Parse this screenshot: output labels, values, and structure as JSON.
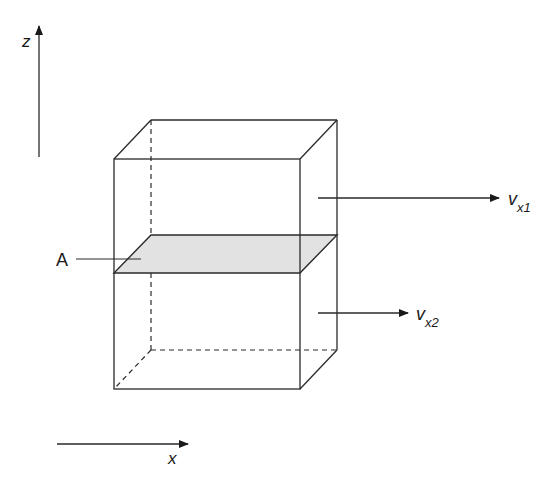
{
  "diagram": {
    "type": "3d-box-shear-flow",
    "axes": {
      "z": {
        "label": "z",
        "direction": "up"
      },
      "x": {
        "label": "x",
        "direction": "right"
      }
    },
    "plane": {
      "label": "A",
      "fill": "#e2e2e2"
    },
    "velocities": [
      {
        "symbol": "v",
        "subscript": "x1",
        "position": "upper half"
      },
      {
        "symbol": "v",
        "subscript": "x2",
        "position": "lower half"
      }
    ],
    "colors": {
      "stroke": "#2a2a2a",
      "plane_fill": "#e2e2e2",
      "background": "#ffffff"
    }
  }
}
